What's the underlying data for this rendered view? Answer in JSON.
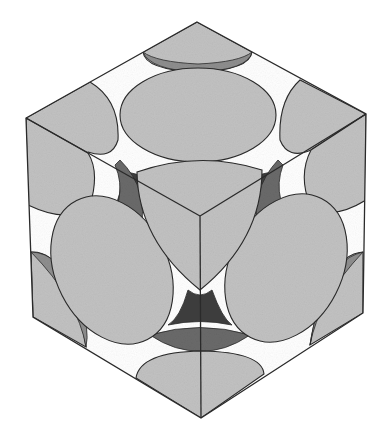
{
  "diagram": {
    "title": "",
    "colors": {
      "background": "#ffffff",
      "sphere": "#c2c2c2",
      "sphere_shade": "#8e8e8e",
      "void_dark": "#3f3f3f",
      "void_mid": "#6a6a6a",
      "edge": "#2a2a2a"
    },
    "cube": {
      "vertices": {
        "top": [
          197,
          22
        ],
        "upper_left": [
          26,
          118
        ],
        "upper_right": [
          366,
          114
        ],
        "center": [
          200,
          216
        ],
        "lower_left": [
          33,
          317
        ],
        "lower_right": [
          363,
          313
        ],
        "bottom": [
          201,
          418
        ]
      }
    },
    "spheres": [
      {
        "id": "top-face-center",
        "type": "ellipse",
        "cx": 198,
        "cy": 115,
        "rx": 78,
        "ry": 47,
        "rot": 0
      },
      {
        "id": "left-face-center",
        "type": "ellipse",
        "cx": 112,
        "cy": 270,
        "rx": 56,
        "ry": 78,
        "rot": -27
      },
      {
        "id": "right-face-center",
        "type": "ellipse",
        "cx": 286,
        "cy": 268,
        "rx": 56,
        "ry": 78,
        "rot": 27
      }
    ]
  }
}
